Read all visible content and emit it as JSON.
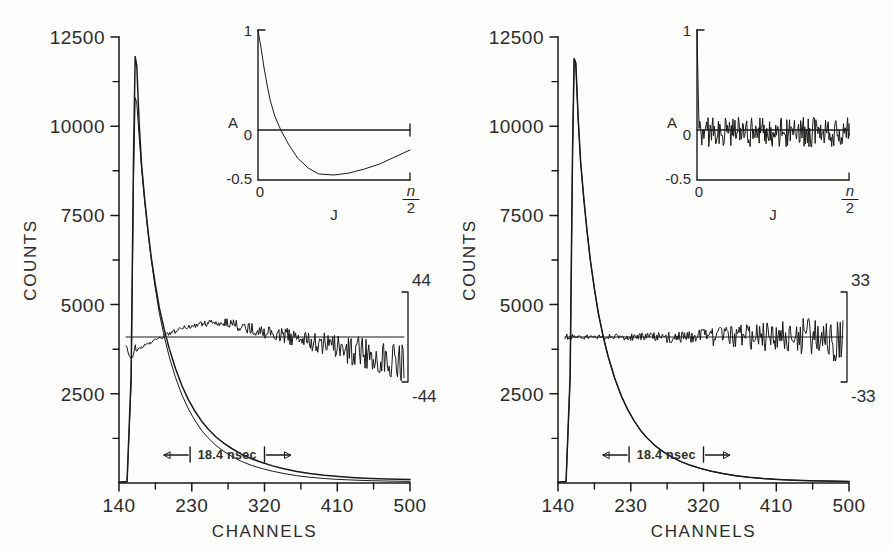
{
  "figure": {
    "background_color": "#fdfdfc",
    "ink_color": "#1a1a1a",
    "panel_count": 2
  },
  "panels": [
    {
      "id": "left",
      "name": "single-exponential-fit",
      "axes": {
        "ylabel": "COUNTS",
        "xlabel": "CHANNELS",
        "ytick_labels": [
          "12500",
          "10000",
          "7500",
          "5000",
          "2500"
        ],
        "ytick_values": [
          12500,
          10000,
          7500,
          5000,
          2500
        ],
        "xtick_labels": [
          "140",
          "230",
          "320",
          "410",
          "500"
        ],
        "xtick_values": [
          140,
          230,
          320,
          410,
          500
        ],
        "xlim": [
          140,
          500
        ],
        "ylim": [
          0,
          12500
        ],
        "minor_ticks": true,
        "grid": false
      },
      "annotation": {
        "width_label": "18.4  nsec",
        "arrow_left": "←",
        "arrow_right": "→"
      },
      "residual": {
        "top_label": "44",
        "bottom_label": "-44",
        "scale": 44,
        "zero_counts": 4150
      },
      "inset": {
        "name": "autocorrelation",
        "ylabel": "A",
        "xlabel": "J",
        "ytick_labels": [
          "1",
          "0",
          "-0.5"
        ],
        "ytick_values": [
          1,
          0,
          -0.5
        ],
        "xtick_labels": [
          "0",
          "n/2"
        ],
        "x_end_numerator": "n",
        "x_end_denominator": "2",
        "ylim": [
          -0.5,
          1
        ]
      }
    },
    {
      "id": "right",
      "name": "double-exponential-fit",
      "axes": {
        "ylabel": "COUNTS",
        "xlabel": "CHANNELS",
        "ytick_labels": [
          "12500",
          "10000",
          "7500",
          "5000",
          "2500"
        ],
        "ytick_values": [
          12500,
          10000,
          7500,
          5000,
          2500
        ],
        "xtick_labels": [
          "140",
          "230",
          "320",
          "410",
          "500"
        ],
        "xtick_values": [
          140,
          230,
          320,
          410,
          500
        ],
        "xlim": [
          140,
          500
        ],
        "ylim": [
          0,
          12500
        ],
        "minor_ticks": true,
        "grid": false
      },
      "annotation": {
        "width_label": "18.4  nsec",
        "arrow_left": "←",
        "arrow_right": "→"
      },
      "residual": {
        "top_label": "33",
        "bottom_label": "-33",
        "scale": 33,
        "zero_counts": 4150
      },
      "inset": {
        "name": "autocorrelation",
        "ylabel": "A",
        "xlabel": "J",
        "ytick_labels": [
          "1",
          "0",
          "-0.5"
        ],
        "ytick_values": [
          1,
          0,
          -0.5
        ],
        "xtick_labels": [
          "0",
          "n/2"
        ],
        "x_end_numerator": "n",
        "x_end_denominator": "2",
        "ylim": [
          -0.5,
          1
        ]
      }
    }
  ],
  "chart_data": {
    "type": "line",
    "title": "",
    "xlabel": "CHANNELS",
    "ylabel": "COUNTS",
    "xlim": [
      140,
      500
    ],
    "ylim": [
      0,
      12500
    ],
    "xticks": [
      140,
      230,
      320,
      410,
      500
    ],
    "yticks": [
      2500,
      5000,
      7500,
      10000,
      12500
    ],
    "grid": false,
    "legend": "none",
    "panels": [
      {
        "panel": "left",
        "series": [
          {
            "name": "measured-decay",
            "x": [
              140,
              150,
              155,
              158,
              160,
              162,
              165,
              168,
              172,
              176,
              180,
              185,
              190,
              196,
              202,
              210,
              218,
              226,
              234,
              242,
              250,
              260,
              270,
              280,
              292,
              304,
              316,
              330,
              344,
              360,
              376,
              394,
              412,
              432,
              452,
              472,
              500
            ],
            "y": [
              20,
              40,
              3000,
              9200,
              11950,
              11700,
              10050,
              8900,
              7900,
              7050,
              6300,
              5550,
              4900,
              4300,
              3780,
              3200,
              2720,
              2330,
              2010,
              1740,
              1520,
              1290,
              1110,
              960,
              800,
              680,
              580,
              480,
              400,
              325,
              268,
              215,
              180,
              150,
              125,
              110,
              95
            ]
          },
          {
            "name": "single-exponential-fit",
            "x": [
              140,
              150,
              155,
              158,
              160,
              162,
              165,
              168,
              172,
              176,
              180,
              185,
              190,
              196,
              202,
              210,
              218,
              226,
              234,
              242,
              250,
              260,
              270,
              280,
              292,
              304,
              316,
              330,
              344,
              360,
              376,
              394,
              412,
              432,
              452,
              472,
              500
            ],
            "y": [
              20,
              40,
              2800,
              8600,
              10800,
              10650,
              9700,
              8800,
              7850,
              7000,
              6250,
              5450,
              4750,
              4100,
              3550,
              2950,
              2460,
              2070,
              1750,
              1480,
              1270,
              1050,
              880,
              740,
              600,
              495,
              410,
              330,
              265,
              205,
              162,
              125,
              100,
              80,
              65,
              55,
              45
            ]
          }
        ],
        "residual_trace_description": "Systematic S-shaped deviation: dips below zero near channel 150, rises to a broad positive hump around channels 225-250, then drifts steadily negative through channel 500 with growing noise.",
        "residual_scale": 44,
        "inset_autocorrelation": {
          "description": "Smooth curve starting at A=1, crossing zero early, reaching a minimum near A=-0.45, then rising slowly toward A=-0.15 at n/2 — indicating correlated (non-random) residuals.",
          "x": [
            0,
            0.02,
            0.04,
            0.06,
            0.08,
            0.11,
            0.15,
            0.2,
            0.26,
            0.33,
            0.4,
            0.5,
            0.6,
            0.7,
            0.8,
            0.9,
            1.0
          ],
          "y": [
            1.0,
            0.82,
            0.62,
            0.45,
            0.3,
            0.14,
            0.0,
            -0.14,
            -0.28,
            -0.38,
            -0.44,
            -0.45,
            -0.43,
            -0.39,
            -0.34,
            -0.27,
            -0.2
          ]
        }
      },
      {
        "panel": "right",
        "series": [
          {
            "name": "measured-decay",
            "x": [
              140,
              150,
              155,
              158,
              160,
              162,
              165,
              168,
              172,
              176,
              180,
              185,
              190,
              196,
              202,
              210,
              218,
              226,
              234,
              242,
              250,
              260,
              270,
              280,
              292,
              304,
              316,
              330,
              344,
              360,
              376,
              394,
              412,
              432,
              452,
              472,
              500
            ],
            "y": [
              20,
              40,
              3000,
              9300,
              11900,
              11780,
              10200,
              9000,
              7950,
              7050,
              6250,
              5450,
              4750,
              4100,
              3550,
              2950,
              2460,
              2070,
              1750,
              1480,
              1270,
              1050,
              880,
              740,
              600,
              495,
              410,
              330,
              265,
              205,
              162,
              125,
              100,
              80,
              65,
              55,
              45
            ]
          },
          {
            "name": "double-exponential-fit",
            "x": [
              140,
              150,
              155,
              158,
              160,
              162,
              165,
              168,
              172,
              176,
              180,
              185,
              190,
              196,
              202,
              210,
              218,
              226,
              234,
              242,
              250,
              260,
              270,
              280,
              292,
              304,
              316,
              330,
              344,
              360,
              376,
              394,
              412,
              432,
              452,
              472,
              500
            ],
            "y": [
              20,
              40,
              2950,
              9250,
              11880,
              11760,
              10180,
              8990,
              7940,
              7040,
              6240,
              5440,
              4740,
              4090,
              3540,
              2940,
              2450,
              2060,
              1745,
              1475,
              1265,
              1045,
              875,
              735,
              597,
              492,
              408,
              328,
              263,
              203,
              160,
              124,
              99,
              79,
              64,
              54,
              44
            ]
          }
        ],
        "residual_trace_description": "Random scatter about zero across the whole range with amplitude growing toward channel 500 — indicating a good fit.",
        "residual_scale": 33,
        "inset_autocorrelation": {
          "description": "Random noise oscillating tightly about A=0 across the full J range, starting from A=1 at J=0 — indicating uncorrelated residuals.",
          "x": [
            0,
            0.01,
            0.05,
            0.1,
            0.2,
            0.3,
            0.4,
            0.5,
            0.6,
            0.7,
            0.8,
            0.9,
            1.0
          ],
          "y": [
            1.0,
            0.05,
            -0.08,
            0.06,
            -0.05,
            0.07,
            -0.04,
            0.05,
            -0.06,
            0.04,
            -0.03,
            0.05,
            -0.02
          ]
        }
      }
    ]
  }
}
